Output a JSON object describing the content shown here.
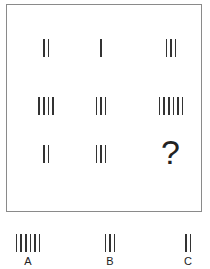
{
  "puzzle": {
    "grid": [
      [
        2,
        1,
        3
      ],
      [
        4,
        3,
        6
      ],
      [
        2,
        3,
        "?"
      ]
    ],
    "question_mark": "?"
  },
  "options": [
    {
      "label": "A",
      "count": 6
    },
    {
      "label": "B",
      "count": 3
    },
    {
      "label": "C",
      "count": 2
    }
  ],
  "colors": {
    "ink": "#333333",
    "frame": "#8a8a8a",
    "background": "#ffffff"
  }
}
